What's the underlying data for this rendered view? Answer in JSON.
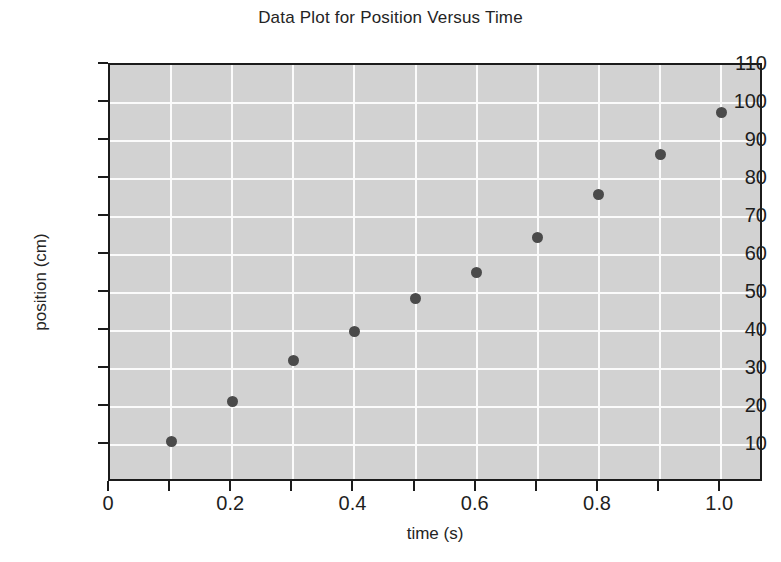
{
  "chart_data": {
    "type": "scatter",
    "title": "Data Plot for Position Versus Time",
    "xlabel": "time (s)",
    "ylabel": "position (cm)",
    "xlim": [
      0,
      1.07
    ],
    "ylim": [
      0,
      110
    ],
    "grid": true,
    "legend": null,
    "x_ticks": [
      0,
      0.1,
      0.2,
      0.3,
      0.4,
      0.5,
      0.6,
      0.7,
      0.8,
      0.9,
      1.0
    ],
    "x_tick_labels": [
      "0",
      "0.2",
      "0.4",
      "0.6",
      "0.8",
      "1.0"
    ],
    "x_tick_label_values": [
      0,
      0.2,
      0.4,
      0.6,
      0.8,
      1.0
    ],
    "y_ticks": [
      10,
      20,
      30,
      40,
      50,
      60,
      70,
      80,
      90,
      100,
      110
    ],
    "y_tick_labels": [
      "10",
      "20",
      "30",
      "40",
      "50",
      "60",
      "70",
      "80",
      "90",
      "100",
      "110"
    ],
    "x": [
      0.1,
      0.2,
      0.3,
      0.4,
      0.5,
      0.6,
      0.7,
      0.8,
      0.9,
      1.0
    ],
    "values": [
      10.8,
      21.5,
      32.3,
      39.8,
      48.5,
      55.3,
      64.5,
      75.8,
      86.5,
      97.5
    ],
    "series": [
      {
        "name": "position",
        "marker": "filled-circle",
        "color": "#4a4a4a",
        "points": [
          {
            "x": 0.1,
            "y": 10.8
          },
          {
            "x": 0.2,
            "y": 21.5
          },
          {
            "x": 0.3,
            "y": 32.3
          },
          {
            "x": 0.4,
            "y": 39.8
          },
          {
            "x": 0.5,
            "y": 48.5
          },
          {
            "x": 0.6,
            "y": 55.3
          },
          {
            "x": 0.7,
            "y": 64.5
          },
          {
            "x": 0.8,
            "y": 75.8
          },
          {
            "x": 0.9,
            "y": 86.5
          },
          {
            "x": 1.0,
            "y": 97.5
          }
        ]
      }
    ],
    "colors": {
      "plot_background": "#d2d2d2",
      "gridline": "#fbfbfb",
      "axis": "#1b1b1b",
      "marker": "#4a4a4a",
      "text": "#242424",
      "page_background": "#ffffff"
    }
  }
}
